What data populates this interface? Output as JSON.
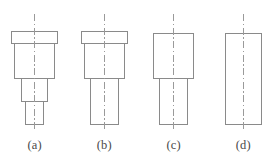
{
  "drawing": {
    "title": "Stepped shaft profile variants",
    "stroke_color": "#8a8a8a",
    "centerline_color": "#9a9a9a",
    "background_color": "#ffffff",
    "label_color": "#4a4a4a",
    "stroke_width": 1,
    "canvas": {
      "width": 278,
      "height": 163
    }
  },
  "figures": [
    {
      "id": "a",
      "label": "(a)",
      "label_text": "(a)",
      "cell_x": 0,
      "step_count": 4,
      "description": "four-diameter stepped pin: thin flange, wide body, medium step, narrow tip",
      "centerline": {
        "x": 34,
        "y_top": 14,
        "y_bottom": 132
      },
      "steps": [
        {
          "name": "flange",
          "x": 11.5,
          "y": 31,
          "width": 46,
          "height": 12
        },
        {
          "name": "body",
          "x": 14.5,
          "y": 43,
          "width": 40,
          "height": 35
        },
        {
          "name": "middle-step",
          "x": 21.5,
          "y": 78,
          "width": 26,
          "height": 23
        },
        {
          "name": "tip",
          "x": 25.5,
          "y": 101,
          "width": 18,
          "height": 23
        }
      ]
    },
    {
      "id": "b",
      "label": "(b)",
      "label_text": "(b)",
      "cell_x": 69.5,
      "step_count": 3,
      "description": "three-diameter stepped pin: thin flange, wide body, long narrow shaft",
      "centerline": {
        "x": 34,
        "y_top": 14,
        "y_bottom": 132
      },
      "steps": [
        {
          "name": "flange",
          "x": 11.5,
          "y": 31,
          "width": 46,
          "height": 12
        },
        {
          "name": "body",
          "x": 14.5,
          "y": 43,
          "width": 40,
          "height": 35
        },
        {
          "name": "shaft",
          "x": 20.5,
          "y": 78,
          "width": 28,
          "height": 46
        }
      ]
    },
    {
      "id": "c",
      "label": "(c)",
      "label_text": "(c)",
      "cell_x": 139,
      "step_count": 2,
      "description": "two-diameter shaft: wide head and narrower shaft",
      "centerline": {
        "x": 34,
        "y_top": 14,
        "y_bottom": 132
      },
      "steps": [
        {
          "name": "head",
          "x": 14.5,
          "y": 33,
          "width": 40,
          "height": 45
        },
        {
          "name": "shaft",
          "x": 20.5,
          "y": 78,
          "width": 28,
          "height": 46
        }
      ]
    },
    {
      "id": "d",
      "label": "(d)",
      "label_text": "(d)",
      "cell_x": 208.5,
      "step_count": 1,
      "description": "plain cylinder, single uniform diameter",
      "centerline": {
        "x": 34,
        "y_top": 14,
        "y_bottom": 132
      },
      "steps": [
        {
          "name": "body",
          "x": 16.5,
          "y": 33,
          "width": 36,
          "height": 91
        }
      ]
    }
  ]
}
